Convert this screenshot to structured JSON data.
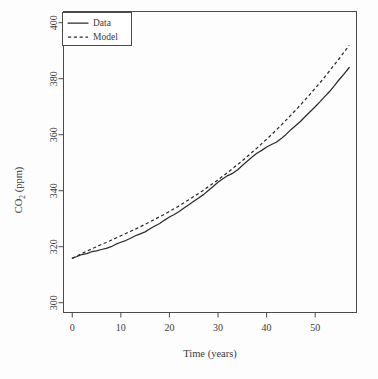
{
  "chart_data": {
    "type": "line",
    "title": "",
    "xlabel": "Time (years)",
    "ylabel": "CO2 (ppm)",
    "ylabel_main": "CO",
    "ylabel_sub": "2",
    "ylabel_unit": " (ppm)",
    "xlim": [
      -1.8,
      58.5
    ],
    "ylim": [
      296.5,
      404.0
    ],
    "xticks": [
      0,
      10,
      20,
      30,
      40,
      50
    ],
    "xticklabels": [
      "0",
      "10",
      "20",
      "30",
      "40",
      "50"
    ],
    "yticks": [
      300,
      320,
      340,
      360,
      380,
      400
    ],
    "yticklabels": [
      "300",
      "320",
      "340",
      "360",
      "380",
      "400"
    ],
    "grid": false,
    "legend_position": "top-left",
    "legend": [
      {
        "label": "Data",
        "style": "solid"
      },
      {
        "label": "Model",
        "style": "dashed"
      }
    ],
    "series": [
      {
        "name": "Data",
        "style": "solid",
        "x": [
          0,
          1,
          2,
          3,
          4,
          5,
          6,
          7,
          8,
          9,
          10,
          11,
          12,
          13,
          14,
          15,
          16,
          17,
          18,
          19,
          20,
          21,
          22,
          23,
          24,
          25,
          26,
          27,
          28,
          29,
          30,
          31,
          32,
          33,
          34,
          35,
          36,
          37,
          38,
          39,
          40,
          41,
          42,
          43,
          44,
          45,
          46,
          47,
          48,
          49,
          50,
          51,
          52,
          53,
          54,
          55,
          56,
          57
        ],
        "y": [
          315.9,
          316.5,
          317.2,
          317.5,
          318.2,
          318.5,
          319.0,
          319.4,
          320.0,
          320.9,
          321.6,
          322.2,
          323.0,
          323.9,
          324.6,
          325.3,
          326.4,
          327.4,
          328.3,
          329.5,
          330.6,
          331.5,
          332.6,
          333.8,
          335.0,
          336.2,
          337.4,
          338.6,
          340.1,
          341.5,
          343.0,
          344.3,
          345.4,
          346.2,
          347.4,
          349.0,
          350.5,
          352.0,
          353.4,
          354.4,
          355.6,
          356.5,
          357.3,
          358.6,
          360.1,
          361.8,
          363.3,
          364.8,
          366.6,
          368.3,
          370.0,
          371.8,
          373.7,
          375.5,
          377.6,
          379.8,
          381.8,
          384.0
        ]
      },
      {
        "name": "Model",
        "style": "dashed",
        "x": [
          0,
          1,
          2,
          3,
          4,
          5,
          6,
          7,
          8,
          9,
          10,
          11,
          12,
          13,
          14,
          15,
          16,
          17,
          18,
          19,
          20,
          21,
          22,
          23,
          24,
          25,
          26,
          27,
          28,
          29,
          30,
          31,
          32,
          33,
          34,
          35,
          36,
          37,
          38,
          39,
          40,
          41,
          42,
          43,
          44,
          45,
          46,
          47,
          48,
          49,
          50,
          51,
          52,
          53,
          54,
          55,
          56,
          57
        ],
        "y": [
          315.8,
          316.7,
          317.6,
          318.4,
          319.2,
          320.0,
          320.8,
          321.5,
          322.3,
          323.1,
          323.9,
          324.7,
          325.5,
          326.3,
          327.1,
          328.0,
          328.9,
          329.8,
          330.7,
          331.6,
          332.6,
          333.6,
          334.6,
          335.7,
          336.8,
          337.9,
          339.0,
          340.2,
          341.4,
          342.6,
          343.9,
          345.2,
          346.5,
          347.9,
          349.3,
          350.7,
          352.2,
          353.7,
          355.2,
          356.8,
          358.4,
          360.0,
          361.7,
          363.4,
          365.2,
          367.0,
          368.8,
          370.7,
          372.6,
          374.6,
          376.6,
          378.6,
          380.7,
          382.9,
          385.1,
          387.3,
          389.6,
          391.9
        ]
      }
    ],
    "annotations": {
      "note_data_end_value": 402,
      "note_start_value": 316
    }
  }
}
